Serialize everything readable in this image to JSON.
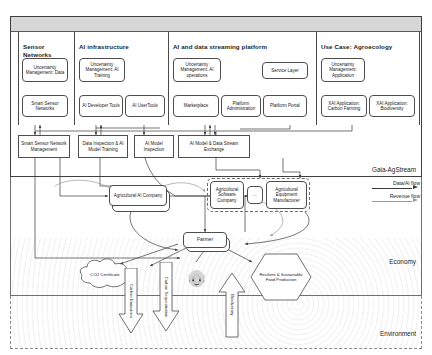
{
  "diagram": {
    "layers": [
      {
        "name": "gaia_agstream",
        "label": "Gaia-AgStream"
      },
      {
        "name": "economy",
        "label": "Economy"
      },
      {
        "name": "environment",
        "label": "Environment"
      }
    ],
    "columns": [
      {
        "id": "sensor-networks",
        "title": "Sensor Networks",
        "boxes": [
          {
            "id": "um-data",
            "label": "Uncertainty Management: Data",
            "shape": "rounded"
          },
          {
            "id": "smart-sensor-networks",
            "label": "Smart Sensor Networks",
            "shape": "rounded"
          }
        ]
      },
      {
        "id": "ai-infrastructure",
        "title": "AI infrastructure",
        "boxes": [
          {
            "id": "um-ai-training",
            "label": "Uncertainty Management: AI Training",
            "shape": "rounded"
          },
          {
            "id": "ai-developer-tools",
            "label": "AI Developer Tools",
            "shape": "rounded"
          },
          {
            "id": "ai-user-tools",
            "label": "AI UserTools",
            "shape": "rounded"
          }
        ]
      },
      {
        "id": "ai-data-streaming-platform",
        "title": "AI and data streaming platform",
        "boxes": [
          {
            "id": "um-ai-operations",
            "label": "Uncertainty Management: AI operations",
            "shape": "rounded"
          },
          {
            "id": "service-layer",
            "label": "Service Layer",
            "shape": "rounded"
          },
          {
            "id": "marketplace",
            "label": "Marketplace",
            "shape": "rounded"
          },
          {
            "id": "platform-administration",
            "label": "Platform Administration",
            "shape": "rounded"
          },
          {
            "id": "platform-portal",
            "label": "Platform Portal",
            "shape": "rounded"
          }
        ]
      },
      {
        "id": "use-case-agroecology",
        "title": "Use Case: Agroecology",
        "boxes": [
          {
            "id": "um-application",
            "label": "Uncertainty Management: Application",
            "shape": "rounded"
          },
          {
            "id": "xai-carbon-farming",
            "label": "XAI Application: Carbon Farming",
            "shape": "rounded"
          },
          {
            "id": "xai-biodiversity",
            "label": "XAI Application: Biodiversity",
            "shape": "rounded"
          }
        ]
      }
    ],
    "service_row": [
      {
        "id": "smart-sensor-network-management",
        "label": "Smart Sensor Network Management"
      },
      {
        "id": "data-inspection-ai-model-training",
        "label": "Data Inspection & AI Model Training"
      },
      {
        "id": "ai-model-inspection",
        "label": "AI Model Inspection"
      },
      {
        "id": "ai-model-data-stream-exchange",
        "label": "AI Model & Data Stream Exchange"
      }
    ],
    "actors": [
      {
        "id": "agricultural-ai-company",
        "label": "Agricultural AI Company",
        "style": "stacked-rounded"
      },
      {
        "id": "agricultural-software-company",
        "label": "Agricultural Software Company",
        "style": "rounded-in-group"
      },
      {
        "id": "ellipsis",
        "label": "…",
        "style": "rounded-in-group"
      },
      {
        "id": "agricultural-equipment-manufacturer",
        "label": "Agricultural Equipment Manufacturer",
        "style": "rounded-in-group"
      },
      {
        "id": "farmer",
        "label": "Farmer",
        "style": "stacked-rounded"
      }
    ],
    "farmer_icon": "farmer-person-icon",
    "environment_items": [
      {
        "id": "co2-certificate",
        "label": "CO2 Certificate",
        "shape": "cloud"
      },
      {
        "id": "carbon-emissions",
        "label": "Carbon Emissions",
        "shape": "block-arrow-down"
      },
      {
        "id": "carbon-sequestration",
        "label": "Carbon Sequestration",
        "shape": "block-arrow-down"
      },
      {
        "id": "biodiversity",
        "label": "Biodiversity",
        "shape": "block-arrow-up"
      },
      {
        "id": "resilient-sustainable-food-production",
        "label": "Resilient & Sustainable Food Production",
        "shape": "hexagon"
      }
    ],
    "legend": {
      "items": [
        {
          "id": "data-ai-flow",
          "label": "Data/AI flow",
          "color": "#3a3a3a"
        },
        {
          "id": "revenue-flow",
          "label": "Revenue flow",
          "color": "#9a9a9a"
        }
      ]
    },
    "colors": {
      "header_bar": "#d7d7d7",
      "frame_dark": "#3f3f3f",
      "frame_mid": "#6f6f6f",
      "frame_dashed": "#8a8a8a",
      "box_border": "#4d4d4d",
      "text": "#1a1a1a"
    }
  }
}
